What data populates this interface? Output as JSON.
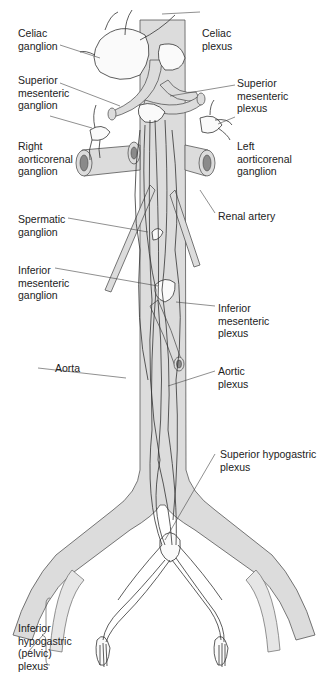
{
  "figure": {
    "labels": {
      "celiac_ganglion": "Celiac\nganglion",
      "celiac_plexus": "Celiac\nplexus",
      "superior_mesenteric_ganglion": "Superior\nmesenteric\nganglion",
      "superior_mesenteric_plexus": "Superior\nmesenteric\nplexus",
      "right_aorticorenal_ganglion": "Right\naorticorenal\nganglion",
      "left_aorticorenal_ganglion": "Left\naorticorenal\nganglion",
      "renal_artery": "Renal artery",
      "spermatic_ganglion": "Spermatic\nganglion",
      "inferior_mesenteric_ganglion": "Inferior\nmesenteric\nganglion",
      "inferior_mesenteric_plexus": "Inferior\nmesenteric\nplexus",
      "aorta": "Aorta",
      "aortic_plexus": "Aortic\nplexus",
      "superior_hypogastric_plexus": "Superior hypogastric\nplexus",
      "inferior_hypogastric_plexus": "Inferior\nhypogastric\n(pelvic)\nplexus"
    },
    "colors": {
      "vessel_fill": "#dcdcdc",
      "outline": "#333333",
      "background": "#ffffff",
      "text": "#222222"
    }
  }
}
